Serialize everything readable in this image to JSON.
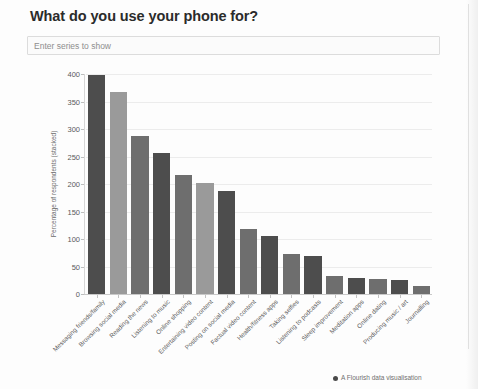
{
  "title": "What do you use your phone for?",
  "series_input": {
    "placeholder": "Enter series to show",
    "value": ""
  },
  "credit": {
    "text": "A Flourish data visualisation",
    "icon": "flourish-dot-icon"
  },
  "colors": {
    "bar_dark": "#4d4d4d",
    "bar_light": "#9a9a9a",
    "bar_mid": "#6e6e6e",
    "grid": "#ececec",
    "axis": "#c9c9c9",
    "title": "#2b2b2b",
    "tick_text": "#5a5a5a",
    "placeholder": "#8e8e8e"
  },
  "chart_data": {
    "type": "bar",
    "title": "What do you use your phone for?",
    "xlabel": "",
    "ylabel": "Percentage of respondents (stacked)",
    "ylim": [
      0,
      400
    ],
    "yticks": [
      0,
      50,
      100,
      150,
      200,
      250,
      300,
      350,
      400
    ],
    "grid": true,
    "legend": false,
    "orientation": "vertical",
    "categories": [
      "Messaging friends/family",
      "Browsing social media",
      "Reading the news",
      "Listening to music",
      "Online shopping",
      "Entertaining video content",
      "Posting on social media",
      "Factual video content",
      "Health/fitness apps",
      "Taking selfies",
      "Listening to podcasts",
      "Sleep improvement",
      "Meditation apps",
      "Online dating",
      "Producing music / art",
      "Journalling"
    ],
    "values": [
      398,
      367,
      288,
      257,
      216,
      201,
      188,
      119,
      105,
      73,
      70,
      33,
      30,
      28,
      26,
      15
    ],
    "bar_shades": [
      "dark",
      "light",
      "mid",
      "dark",
      "mid",
      "light",
      "dark",
      "mid",
      "dark",
      "mid",
      "dark",
      "mid",
      "dark",
      "mid",
      "dark",
      "mid"
    ]
  }
}
